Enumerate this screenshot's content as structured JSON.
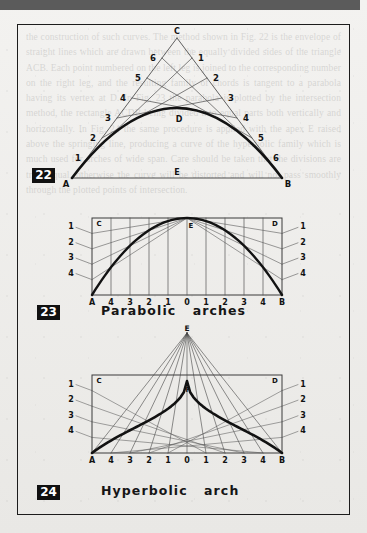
{
  "page": {
    "background_color": "#efeeec",
    "topbar_color": "#5b5b5b",
    "frame_color": "#1c1c1c",
    "ink_color": "#121212",
    "ghost_text": "the construction of such curves. The method shown in Fig. 22 is the envelope of straight lines which are drawn between the equally divided sides of the triangle ACB. Each point numbered on the left leg is joined to the corresponding number on the right leg, and the resulting family of chords is tangent to a parabola having its vertex at D. In Fig. 23 the parabola is plotted by the intersection method, the rectangle ACDB being divided into equal parts both vertically and horizontally. In Fig. 24 the same procedure is applied with the apex E raised above the springing line, producing a curve of the hyperbolic family which is much used for arches of wide span. Care should be taken that the divisions are truly equal, otherwise the curve will be distorted and will not pass smoothly through the plotted points of intersection."
  },
  "figures": [
    {
      "id": "fig-22",
      "badge": "22",
      "caption": "",
      "type": "tangent-envelope-parabola",
      "points": {
        "apex": "C",
        "base_left": "A",
        "base_right": "B",
        "base_mid": "E",
        "curve_vertex": "D"
      },
      "left_leg_labels": [
        "1",
        "2",
        "3",
        "4",
        "5",
        "6"
      ],
      "right_leg_labels": [
        "1",
        "2",
        "3",
        "4",
        "5",
        "6"
      ],
      "divisions": 7
    },
    {
      "id": "fig-23",
      "badge": "23",
      "caption": "Parabolic   arches",
      "type": "parabolic-arch-construction",
      "points": {
        "top_left": "C",
        "top_right": "D",
        "bottom_left": "A",
        "bottom_right": "B",
        "apex": "E"
      },
      "side_labels_left": [
        "1",
        "2",
        "3",
        "4"
      ],
      "side_labels_right": [
        "1",
        "2",
        "3",
        "4"
      ],
      "baseline_labels": [
        "A",
        "4",
        "3",
        "2",
        "1",
        "0",
        "1",
        "2",
        "3",
        "4",
        "B"
      ],
      "divisions": 5
    },
    {
      "id": "fig-24",
      "badge": "24",
      "caption": "Hyperbolic   arch",
      "type": "hyperbolic-arch-construction",
      "points": {
        "top_left": "C",
        "top_right": "D",
        "bottom_left": "A",
        "bottom_right": "B",
        "apex_above": "E",
        "curve_vertex": "F"
      },
      "side_labels_left": [
        "1",
        "2",
        "3",
        "4"
      ],
      "side_labels_right": [
        "1",
        "2",
        "3",
        "4"
      ],
      "baseline_labels": [
        "A",
        "4",
        "3",
        "2",
        "1",
        "0",
        "1",
        "2",
        "3",
        "4",
        "B"
      ],
      "divisions": 5
    }
  ],
  "chart_data": {
    "type": "line",
    "panels": [
      {
        "name": "22",
        "description": "Parabola generated as the envelope of chords joining equally divided legs of triangle A-C-B",
        "triangle": {
          "A": [
            0,
            0
          ],
          "B": [
            10,
            0
          ],
          "C": [
            5,
            7
          ]
        },
        "tangent_chords": 6,
        "vertex_label": "D",
        "midpoint_label": "E"
      },
      {
        "name": "23",
        "description": "Parabolic arch plotted by intersection within rectangle A-C-D-B",
        "xlabel": "",
        "ylabel": "",
        "x": [
          -5,
          -4,
          -3,
          -2,
          -1,
          0,
          1,
          2,
          3,
          4,
          5
        ],
        "y": [
          0.0,
          0.64,
          0.96,
          1.16,
          1.28,
          1.32,
          1.28,
          1.16,
          0.96,
          0.64,
          0.0
        ],
        "xlim": [
          -5,
          5
        ],
        "ylim": [
          0,
          1.4
        ],
        "tick_labels_x": [
          "A",
          "4",
          "3",
          "2",
          "1",
          "0",
          "1",
          "2",
          "3",
          "4",
          "B"
        ],
        "tick_labels_y": [
          "4",
          "3",
          "2",
          "1"
        ],
        "grid": true
      },
      {
        "name": "24",
        "description": "Hyperbolic arch with apex E above the rectangle, vertex F on the curve",
        "xlabel": "",
        "ylabel": "",
        "x": [
          -5,
          -4,
          -3,
          -2,
          -1,
          0,
          1,
          2,
          3,
          4,
          5
        ],
        "y": [
          0.0,
          0.28,
          0.56,
          0.84,
          1.08,
          1.2,
          1.08,
          0.84,
          0.56,
          0.28,
          0.0
        ],
        "xlim": [
          -5,
          5
        ],
        "ylim": [
          0,
          1.6
        ],
        "tick_labels_x": [
          "A",
          "4",
          "3",
          "2",
          "1",
          "0",
          "1",
          "2",
          "3",
          "4",
          "B"
        ],
        "tick_labels_y": [
          "4",
          "3",
          "2",
          "1"
        ],
        "grid": true
      }
    ]
  }
}
